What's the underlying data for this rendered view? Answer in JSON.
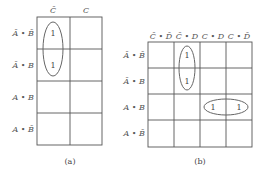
{
  "map_a": {
    "column_labels": [
      "C̄",
      "C"
    ],
    "row_labels": [
      "Ā • B̄",
      "Ā • B",
      "A • B",
      "A • B̄"
    ],
    "cells": [
      [
        "1",
        ""
      ],
      [
        "1",
        ""
      ],
      [
        "",
        ""
      ],
      [
        "",
        ""
      ]
    ],
    "caption": "(a)"
  },
  "map_b": {
    "column_labels": [
      "C̄ • D̄",
      "C̄ • D",
      "C • D",
      "C • D̄"
    ],
    "row_labels": [
      "Ā • B̄",
      "Ā • B",
      "A • B",
      "A • B̄"
    ],
    "cells": [
      [
        "",
        "1",
        "",
        ""
      ],
      [
        "",
        "1",
        "",
        ""
      ],
      [
        "",
        "",
        "1",
        "1"
      ],
      [
        "",
        "",
        "",
        ""
      ]
    ],
    "caption": "(b)"
  },
  "colors": {
    "grid": "#555555",
    "loop": "#666666",
    "text": "#555555"
  }
}
